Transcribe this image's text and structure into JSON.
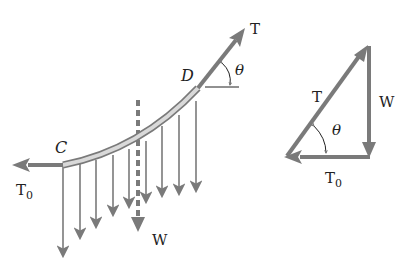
{
  "figure": {
    "colors": {
      "arrow": "#7a7a7a",
      "cable_fill": "#d9d9d9",
      "cable_edge": "#7a7a7a",
      "text": "#222222",
      "background": "#ffffff"
    }
  },
  "cable_diagram": {
    "point_c_label": "C",
    "point_d_label": "D",
    "tension_label": "T",
    "horizontal_tension_label": "T",
    "horizontal_tension_subscript": "0",
    "angle_label": "θ",
    "weight_label": "W",
    "load_arrow_count": 9
  },
  "force_triangle": {
    "tension_label": "T",
    "weight_label": "W",
    "horizontal_tension_label": "T",
    "horizontal_tension_subscript": "0",
    "angle_label": "θ"
  }
}
